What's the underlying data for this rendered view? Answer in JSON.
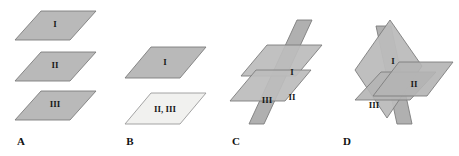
{
  "figure": {
    "background_color": "#ffffff",
    "plane_fill": "#b9b9b9",
    "plane_fill_light": "#f1f1ef",
    "plane_stroke": "#7d7d7d",
    "label_color": "#1a1a1a",
    "panels": [
      {
        "letter": "A",
        "letter_pos": {
          "x": 21,
          "y": 142
        },
        "description": "three parallel horizontal planes stacked",
        "planes": [
          {
            "id": "A-I",
            "label": "I",
            "label_pos": {
              "x": 55,
              "y": 25
            },
            "fill": "#b9b9b9",
            "points": "41,11 96,11 70,40 15,40"
          },
          {
            "id": "A-II",
            "label": "II",
            "label_pos": {
              "x": 55,
              "y": 66
            },
            "fill": "#b9b9b9",
            "points": "41,52 96,52 70,81 15,81"
          },
          {
            "id": "A-III",
            "label": "III",
            "label_pos": {
              "x": 55,
              "y": 105
            },
            "fill": "#b9b9b9",
            "points": "41,91 96,91 70,120 15,120"
          }
        ]
      },
      {
        "letter": "B",
        "letter_pos": {
          "x": 130,
          "y": 142
        },
        "description": "two parallel planes, the lower one coincident for II and III",
        "planes": [
          {
            "id": "B-I",
            "label": "I",
            "label_pos": {
              "x": 165,
              "y": 63
            },
            "fill": "#b9b9b9",
            "points": "151,47 206,47 180,78 125,78"
          },
          {
            "id": "B-II-III",
            "label": "II, III",
            "label_pos": {
              "x": 165,
              "y": 110
            },
            "fill": "#f1f1ef",
            "points": "151,93 206,93 180,124 125,124"
          }
        ]
      },
      {
        "letter": "C",
        "letter_pos": {
          "x": 236,
          "y": 142
        },
        "description": "one plane cutting two parallel planes",
        "planes": [
          {
            "id": "C-III",
            "label": "III",
            "label_pos": {
              "x": 267,
              "y": 101
            },
            "fill": "#b0b0b0",
            "points": "297,20 312,20 264,124 249,124"
          },
          {
            "id": "C-I",
            "label": "I",
            "label_pos": {
              "x": 292,
              "y": 73
            },
            "fill": "#bcbcbc",
            "points": "267,45 322,45 296,76 241,76"
          },
          {
            "id": "C-II",
            "label": "II",
            "label_pos": {
              "x": 292,
              "y": 98
            },
            "fill": "#bcbcbc",
            "points": "256,70 311,70 285,101 230,101"
          }
        ]
      },
      {
        "letter": "D",
        "letter_pos": {
          "x": 347,
          "y": 142
        },
        "description": "three planes intersecting in a single common point",
        "planes": [
          {
            "id": "D-I",
            "label": "I",
            "label_pos": {
              "x": 393,
              "y": 62
            },
            "fill": "#bcbcbc",
            "points": "390,20 422,66 387,118 355,70"
          },
          {
            "id": "D-II",
            "label": "II",
            "label_pos": {
              "x": 414,
              "y": 85
            },
            "fill": "#b4b4b4",
            "points": "399,62 453,62 427,96 373,96"
          },
          {
            "id": "D-III",
            "label": "III",
            "label_pos": {
              "x": 374,
              "y": 106
            },
            "fill": "#b0b0b0",
            "points": "376,26 391,26 412,124 397,124"
          },
          {
            "id": "D-IV",
            "label": "",
            "label_pos": {
              "x": 0,
              "y": 0
            },
            "fill": "#b4b4b4",
            "points": "381,72 436,72 410,100 355,100"
          }
        ]
      }
    ]
  }
}
